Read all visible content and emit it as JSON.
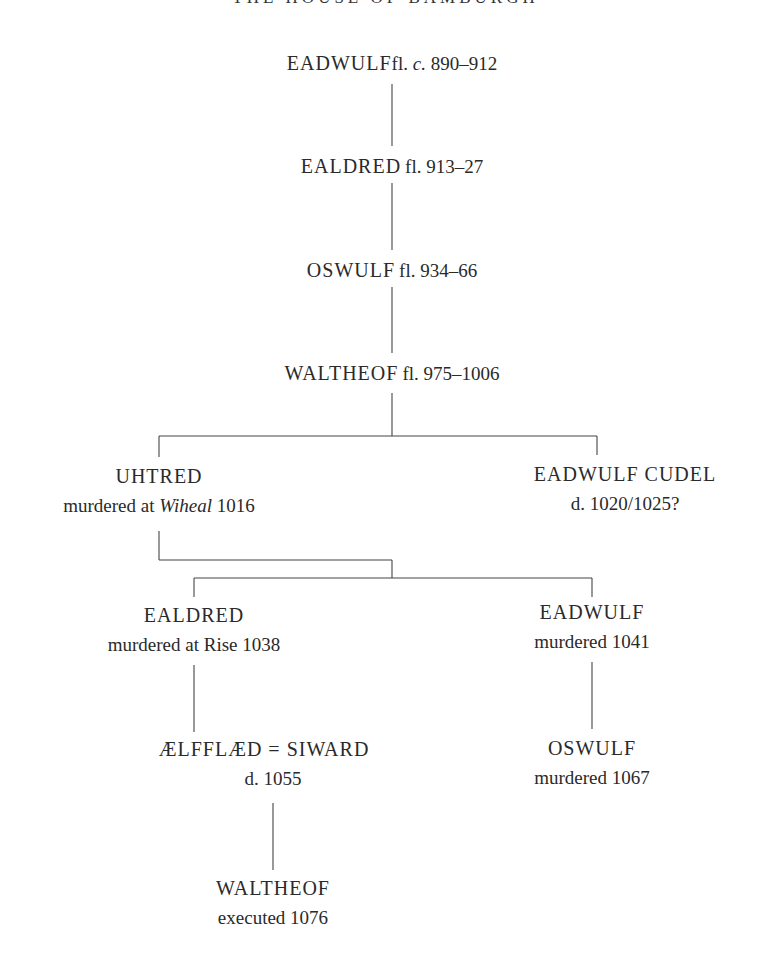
{
  "title": "THE HOUSE OF BAMBURGH",
  "nodes": {
    "eadwulf1": {
      "name": "EADWULF",
      "dates_prefix": "fl. ",
      "dates_italic": "c.",
      "dates": " 890–912"
    },
    "ealdred1": {
      "name": "EALDRED",
      "dates": "fl. 913–27"
    },
    "oswulf1": {
      "name": "OSWULF",
      "dates": "fl. 934–66"
    },
    "waltheof1": {
      "name": "WALTHEOF",
      "dates": "fl. 975–1006"
    },
    "uhtred": {
      "name": "UHTRED",
      "note_prefix": "murdered at ",
      "note_italic": "Wiheal",
      "note_suffix": " 1016"
    },
    "eadwulf_cudel": {
      "name": "EADWULF CUDEL",
      "note": "d. 1020/1025?"
    },
    "ealdred2": {
      "name": "EALDRED",
      "note": "murdered at Rise 1038"
    },
    "eadwulf2": {
      "name": "EADWULF",
      "note": "murdered 1041"
    },
    "aelfflaed_siward": {
      "name": "ÆLFFLÆD = SIWARD",
      "note": "d. 1055"
    },
    "oswulf2": {
      "name": "OSWULF",
      "note": "murdered 1067"
    },
    "waltheof2": {
      "name": "WALTHEOF",
      "note": "executed 1076"
    }
  }
}
